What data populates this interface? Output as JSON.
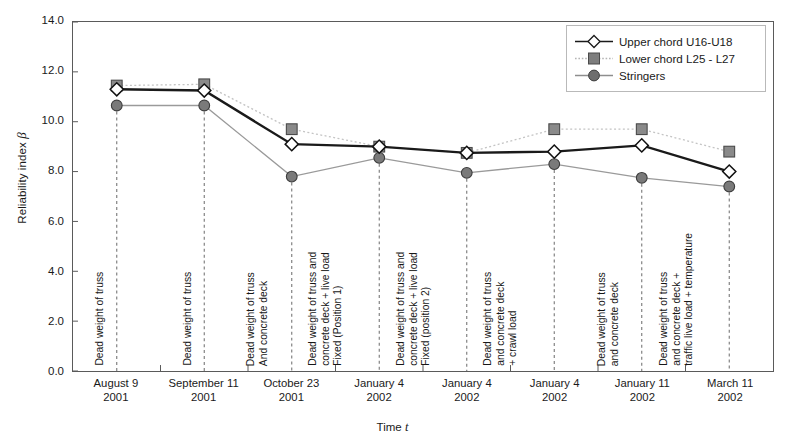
{
  "chart_data": {
    "type": "line",
    "title": "",
    "xlabel": "Time t",
    "ylabel": "Reliability index β",
    "ylim": [
      0.0,
      14.0
    ],
    "yticks": [
      "0.0",
      "2.0",
      "4.0",
      "6.0",
      "8.0",
      "10.0",
      "12.0",
      "14.0"
    ],
    "ytick_values": [
      0.0,
      2.0,
      4.0,
      6.0,
      8.0,
      10.0,
      12.0,
      14.0
    ],
    "grid": false,
    "legend_position": "top-right",
    "categories": [
      {
        "line1": "August 9",
        "line2": "2001"
      },
      {
        "line1": "September 11",
        "line2": "2001"
      },
      {
        "line1": "October 23",
        "line2": "2001"
      },
      {
        "line1": "January 4",
        "line2": "2002"
      },
      {
        "line1": "January 4",
        "line2": "2002"
      },
      {
        "line1": "January 4",
        "line2": "2002"
      },
      {
        "line1": "January 11",
        "line2": "2002"
      },
      {
        "line1": "March 11",
        "line2": "2002"
      }
    ],
    "series": [
      {
        "name": "Upper chord U16-U18",
        "marker": "diamond",
        "color": "#1a1a1a",
        "linestyle": "solid",
        "values": [
          11.3,
          11.25,
          9.1,
          9.0,
          8.75,
          8.8,
          9.05,
          8.0
        ]
      },
      {
        "name": "Lower chord L25 - L27",
        "marker": "square",
        "color": "#7d7d7d",
        "linestyle": "dotted",
        "values": [
          11.45,
          11.5,
          9.7,
          9.0,
          8.75,
          9.7,
          9.7,
          8.8
        ]
      },
      {
        "name": "Stringers",
        "marker": "circle",
        "color": "#6e6e6e",
        "linestyle": "solid",
        "values": [
          10.65,
          10.65,
          7.8,
          8.55,
          7.95,
          8.3,
          7.75,
          7.4
        ]
      }
    ],
    "annotations": [
      {
        "lines": [
          "Dead weight of truss"
        ]
      },
      {
        "lines": [
          "Dead weight of truss"
        ]
      },
      {
        "lines": [
          "Dead weight of truss",
          "And concrete deck"
        ]
      },
      {
        "lines": [
          "Dead weight of truss and",
          "concrete deck + live load",
          "Fixed (Position 1)"
        ]
      },
      {
        "lines": [
          "Dead weight of truss and",
          "concrete deck + live load",
          "Fixed (position 2)"
        ]
      },
      {
        "lines": [
          "Dead weight of truss",
          "and concrete deck",
          "+ crawl load"
        ]
      },
      {
        "lines": [
          "Dead weight of truss",
          "and concrete deck"
        ]
      },
      {
        "lines": [
          "Dead weight of truss",
          "and concrete deck +",
          "traffic live load + temperature"
        ]
      }
    ]
  },
  "legend": {
    "items": [
      {
        "label": "Upper chord U16-U18"
      },
      {
        "label": "Lower chord L25 - L27"
      },
      {
        "label": "Stringers"
      }
    ]
  }
}
